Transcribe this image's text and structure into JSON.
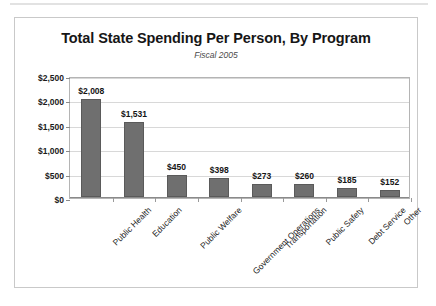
{
  "chart_data": {
    "type": "bar",
    "title": "Total State Spending Per Person, By Program",
    "subtitle": "Fiscal 2005",
    "xlabel": "",
    "ylabel": "",
    "categories": [
      "Public Health",
      "Education",
      "Public Welfare",
      "Government Operations",
      "Transportation",
      "Public Safety",
      "Debt Service",
      "Other"
    ],
    "values": [
      2008,
      1531,
      450,
      398,
      273,
      260,
      185,
      152
    ],
    "value_labels": [
      "$2,008",
      "$1,531",
      "$450",
      "$398",
      "$273",
      "$260",
      "$185",
      "$152"
    ],
    "ylim": [
      0,
      2500
    ],
    "ytick_values": [
      0,
      500,
      1000,
      1500,
      2000,
      2500
    ],
    "ytick_labels": [
      "$0",
      "$500",
      "$1,000",
      "$1,500",
      "$2,000",
      "$2,500"
    ],
    "grid": true,
    "legend": false,
    "bar_color": "#6f6f6f",
    "gridline_color": "#d8d8d8",
    "axis_color": "#8a8a8a",
    "frame_color": "#c9c9c9",
    "background_color": "#ffffff"
  }
}
